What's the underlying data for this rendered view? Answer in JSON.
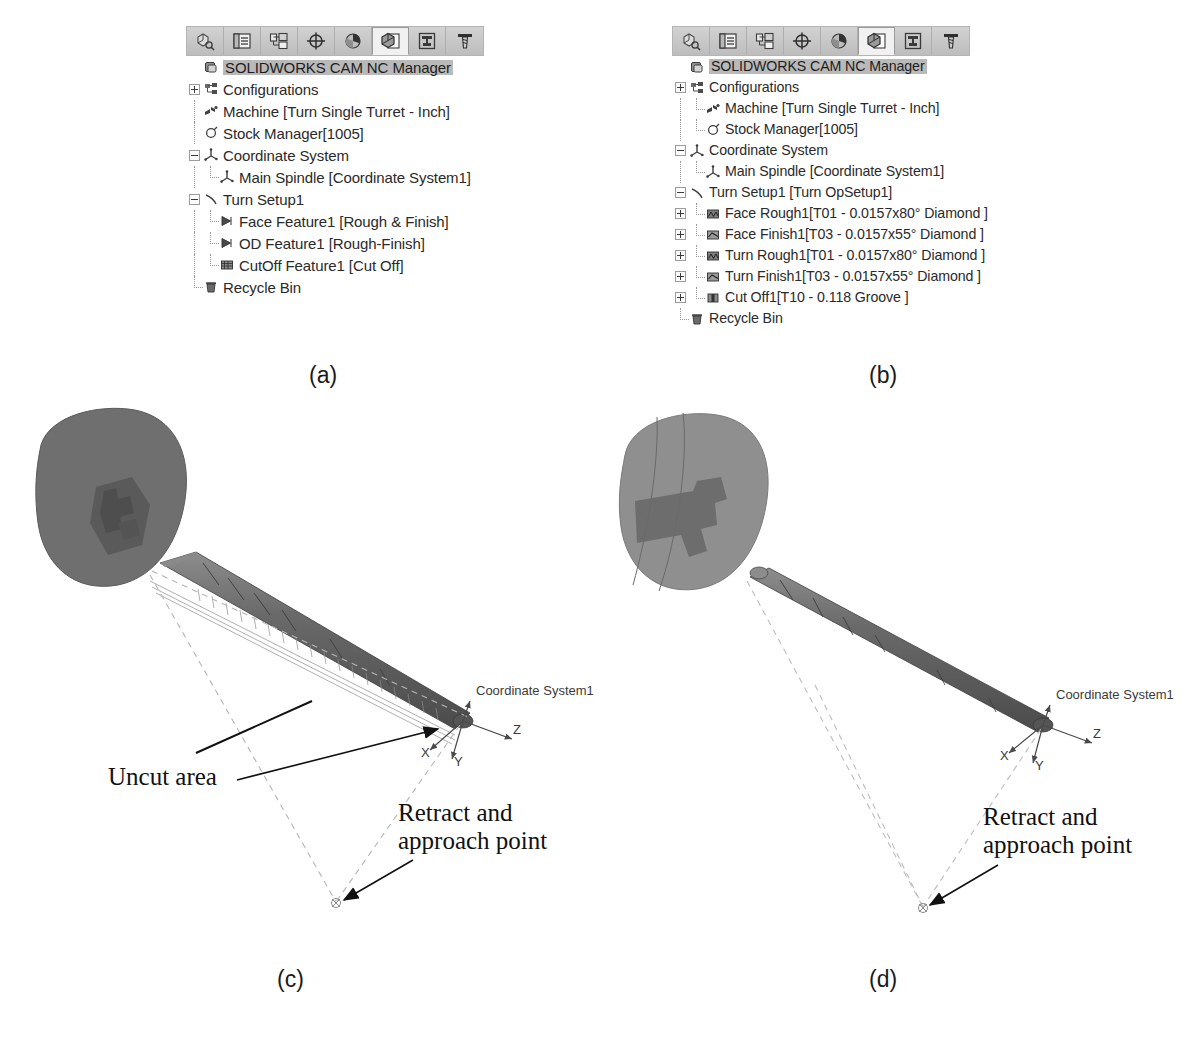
{
  "figure": {
    "captions": [
      {
        "id": "a",
        "text": "(a)"
      },
      {
        "id": "b",
        "text": "(b)"
      },
      {
        "id": "c",
        "text": "(c)"
      },
      {
        "id": "d",
        "text": "(d)"
      }
    ]
  },
  "toolbar": {
    "buttons": [
      {
        "name": "feature-manager-design-tree-icon",
        "title": "FeatureManager design tree",
        "active": false
      },
      {
        "name": "property-manager-icon",
        "title": "PropertyManager",
        "active": false
      },
      {
        "name": "configuration-manager-icon",
        "title": "ConfigurationManager",
        "active": false
      },
      {
        "name": "dimxpert-manager-icon",
        "title": "DimXpertManager",
        "active": false
      },
      {
        "name": "display-manager-icon",
        "title": "DisplayManager",
        "active": false
      },
      {
        "name": "cam-feature-tree-icon",
        "title": "SOLIDWORKS CAM feature tree",
        "active": true
      },
      {
        "name": "cam-operation-tree-icon",
        "title": "SOLIDWORKS CAM operation tree",
        "active": false
      },
      {
        "name": "cam-tool-tree-icon",
        "title": "SOLIDWORKS CAM tool tree",
        "active": false
      }
    ]
  },
  "panel_a": {
    "header": "SOLIDWORKS CAM NC Manager",
    "rows": [
      {
        "label": "Configurations",
        "indent": 0,
        "toggle": "plus",
        "icon": "configurations-icon"
      },
      {
        "label": "Machine [Turn Single Turret - Inch]",
        "indent": 0,
        "toggle": "none",
        "icon": "machine-icon"
      },
      {
        "label": "Stock Manager[1005]",
        "indent": 0,
        "toggle": "none",
        "icon": "stock-manager-icon"
      },
      {
        "label": "Coordinate System",
        "indent": 0,
        "toggle": "minus",
        "icon": "coordinate-system-icon"
      },
      {
        "label": "Main Spindle [Coordinate System1]",
        "indent": 1,
        "toggle": "none",
        "icon": "coordinate-system-icon"
      },
      {
        "label": "Turn Setup1",
        "indent": 0,
        "toggle": "minus",
        "icon": "turn-setup-icon"
      },
      {
        "label": "Face Feature1 [Rough & Finish]",
        "indent": 1,
        "toggle": "none",
        "icon": "face-feature-icon"
      },
      {
        "label": "OD Feature1 [Rough-Finish]",
        "indent": 1,
        "toggle": "none",
        "icon": "od-feature-icon"
      },
      {
        "label": "CutOff Feature1 [Cut Off]",
        "indent": 1,
        "toggle": "none",
        "icon": "cutoff-feature-icon"
      },
      {
        "label": "Recycle Bin",
        "indent": 0,
        "toggle": "none",
        "icon": "recycle-bin-icon"
      }
    ]
  },
  "panel_b": {
    "header": "SOLIDWORKS CAM NC Manager",
    "rows": [
      {
        "label": "Configurations",
        "indent": 0,
        "toggle": "plus",
        "icon": "configurations-icon"
      },
      {
        "label": "Machine [Turn Single Turret - Inch]",
        "indent": 1,
        "toggle": "none",
        "icon": "machine-icon"
      },
      {
        "label": "Stock Manager[1005]",
        "indent": 1,
        "toggle": "none",
        "icon": "stock-manager-icon"
      },
      {
        "label": "Coordinate System",
        "indent": 0,
        "toggle": "minus",
        "icon": "coordinate-system-icon"
      },
      {
        "label": "Main Spindle [Coordinate System1]",
        "indent": 1,
        "toggle": "none",
        "icon": "coordinate-system-icon"
      },
      {
        "label": "Turn Setup1 [Turn OpSetup1]",
        "indent": 0,
        "toggle": "minus",
        "icon": "turn-setup-icon"
      },
      {
        "label": "Face Rough1[T01 - 0.0157x80° Diamond ]",
        "indent": 1,
        "toggle": "plus",
        "icon": "face-rough-op-icon"
      },
      {
        "label": "Face Finish1[T03 - 0.0157x55° Diamond ]",
        "indent": 1,
        "toggle": "plus",
        "icon": "face-finish-op-icon"
      },
      {
        "label": "Turn Rough1[T01 - 0.0157x80° Diamond ]",
        "indent": 1,
        "toggle": "plus",
        "icon": "turn-rough-op-icon"
      },
      {
        "label": "Turn Finish1[T03 - 0.0157x55° Diamond ]",
        "indent": 1,
        "toggle": "plus",
        "icon": "turn-finish-op-icon"
      },
      {
        "label": "Cut Off1[T10 - 0.118 Groove ]",
        "indent": 1,
        "toggle": "plus",
        "icon": "cut-off-op-icon"
      },
      {
        "label": "Recycle Bin",
        "indent": 0,
        "toggle": "none",
        "icon": "recycle-bin-icon"
      }
    ]
  },
  "viewport_c": {
    "coordinate_system_label": "Coordinate System1",
    "axes": {
      "x": "X",
      "y": "Y",
      "z": "Z"
    },
    "annotations": [
      {
        "name": "uncut-area",
        "lines": [
          "Uncut area"
        ]
      },
      {
        "name": "retract-and-approach-point",
        "lines": [
          "Retract and",
          "approach point"
        ]
      }
    ]
  },
  "viewport_d": {
    "coordinate_system_label": "Coordinate System1",
    "axes": {
      "x": "X",
      "y": "Y",
      "z": "Z"
    },
    "annotations": [
      {
        "name": "retract-and-approach-point",
        "lines": [
          "Retract and",
          "approach point"
        ]
      }
    ]
  },
  "colors": {
    "toolbar_bg": "#c9c9c9",
    "header_highlight": "#b9b9b9",
    "stock_body": "#6e6e6e",
    "stock_body_light": "#9a9a9a",
    "toolpath_dashed": "#bdbdbd",
    "text": "#2a2a2a"
  }
}
